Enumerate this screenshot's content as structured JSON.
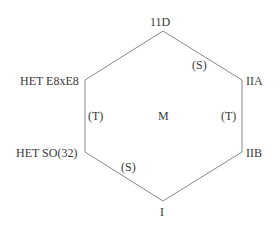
{
  "diagram": {
    "type": "hexagon",
    "line_color": "#8a8a8a",
    "text_color": "#3a3a3a",
    "vertices": [
      {
        "id": "top",
        "label": "11D",
        "x": 163,
        "y": 31
      },
      {
        "id": "upper-right",
        "label": "IIA",
        "x": 242,
        "y": 80
      },
      {
        "id": "lower-right",
        "label": "IIB",
        "x": 242,
        "y": 152
      },
      {
        "id": "bottom",
        "label": "I",
        "x": 163,
        "y": 201
      },
      {
        "id": "lower-left",
        "label": "HET SO(32)",
        "x": 85,
        "y": 152
      },
      {
        "id": "upper-left",
        "label": "HET E8xE8",
        "x": 85,
        "y": 80
      }
    ],
    "edge_labels": {
      "top_right": "(S)",
      "left": "(T)",
      "right": "(T)",
      "bottom_left": "(S)"
    },
    "center_label": "M"
  }
}
